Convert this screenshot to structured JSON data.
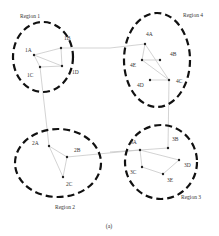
{
  "caption": "(a)",
  "colors": {
    "region_border": "#111111",
    "edge": "#c8c8c8",
    "node": "#222222",
    "text": "#333333"
  },
  "regions": [
    {
      "id": "r1",
      "label": "Region 1",
      "cx": 43,
      "cy": 57,
      "rx": 30,
      "ry": 35,
      "lx": 20,
      "ly": 18
    },
    {
      "id": "r4",
      "label": "Region 4",
      "cx": 157,
      "cy": 60,
      "rx": 33,
      "ry": 47,
      "lx": 183,
      "ly": 17
    },
    {
      "id": "r2",
      "label": "Region 2",
      "cx": 58,
      "cy": 163,
      "rx": 43,
      "ry": 34,
      "lx": 55,
      "ly": 209
    },
    {
      "id": "r3",
      "label": "Region 3",
      "cx": 161,
      "cy": 162,
      "rx": 36,
      "ry": 37,
      "lx": 181,
      "ly": 199
    }
  ],
  "nodes": [
    {
      "id": "1A",
      "label": "1A",
      "x": 34,
      "y": 55,
      "lx": 25,
      "ly": 52
    },
    {
      "id": "1B",
      "label": "1B",
      "x": 61,
      "y": 48,
      "lx": 64,
      "ly": 40
    },
    {
      "id": "1C",
      "label": "1C",
      "x": 40,
      "y": 67,
      "lx": 27,
      "ly": 77
    },
    {
      "id": "1D",
      "label": "1D",
      "x": 62,
      "y": 66,
      "lx": 72,
      "ly": 74
    },
    {
      "id": "4A",
      "label": "4A",
      "x": 145,
      "y": 44,
      "lx": 146,
      "ly": 36
    },
    {
      "id": "4B",
      "label": "4B",
      "x": 160,
      "y": 60,
      "lx": 170,
      "ly": 56
    },
    {
      "id": "4E",
      "label": "4E",
      "x": 142,
      "y": 60,
      "lx": 130,
      "ly": 67
    },
    {
      "id": "4D",
      "label": "4D",
      "x": 150,
      "y": 80,
      "lx": 137,
      "ly": 87
    },
    {
      "id": "4C",
      "label": "4C",
      "x": 169,
      "y": 80,
      "lx": 176,
      "ly": 83
    },
    {
      "id": "2A",
      "label": "2A",
      "x": 49,
      "y": 146,
      "lx": 32,
      "ly": 145
    },
    {
      "id": "2B",
      "label": "2B",
      "x": 67,
      "y": 157,
      "lx": 74,
      "ly": 152
    },
    {
      "id": "2C",
      "label": "2C",
      "x": 63,
      "y": 177,
      "lx": 66,
      "ly": 186
    },
    {
      "id": "3A",
      "label": "3A",
      "x": 140,
      "y": 150,
      "lx": 130,
      "ly": 144
    },
    {
      "id": "3B",
      "label": "3B",
      "x": 168,
      "y": 148,
      "lx": 172,
      "ly": 141
    },
    {
      "id": "3C",
      "label": "3C",
      "x": 142,
      "y": 167,
      "lx": 130,
      "ly": 174
    },
    {
      "id": "3D",
      "label": "3D",
      "x": 179,
      "y": 160,
      "lx": 184,
      "ly": 167
    },
    {
      "id": "3E",
      "label": "3E",
      "x": 163,
      "y": 174,
      "lx": 167,
      "ly": 182
    }
  ],
  "edges": [
    [
      "1A",
      "1B"
    ],
    [
      "1A",
      "1D"
    ],
    [
      "1A",
      "1C"
    ],
    [
      "1C",
      "1D"
    ],
    [
      "1B",
      "1D"
    ],
    [
      "4A",
      "4E"
    ],
    [
      "4E",
      "4B"
    ],
    [
      "4E",
      "4C"
    ],
    [
      "4A",
      "4C"
    ],
    [
      "4D",
      "4C"
    ],
    [
      "2A",
      "2B"
    ],
    [
      "2B",
      "2C"
    ],
    [
      "2A",
      "2C"
    ],
    [
      "3A",
      "3B"
    ],
    [
      "3A",
      "3C"
    ],
    [
      "3A",
      "3D"
    ],
    [
      "3C",
      "3E"
    ],
    [
      "3E",
      "3D"
    ]
  ],
  "links": [
    {
      "from": "1B",
      "to": "4A",
      "points": [
        [
          61,
          48
        ],
        [
          110,
          48
        ],
        [
          145,
          44
        ]
      ]
    },
    {
      "from": "1C",
      "to": "2A",
      "points": [
        [
          40,
          67
        ],
        [
          49,
          146
        ]
      ]
    },
    {
      "from": "4C",
      "to": "3B",
      "points": [
        [
          169,
          80
        ],
        [
          168,
          148
        ]
      ]
    },
    {
      "from": "2B",
      "to": "3A",
      "points": [
        [
          67,
          157
        ],
        [
          140,
          150
        ]
      ]
    },
    {
      "from": "3A",
      "to": "exit",
      "points": [
        [
          140,
          150
        ],
        [
          110,
          152
        ]
      ]
    }
  ]
}
